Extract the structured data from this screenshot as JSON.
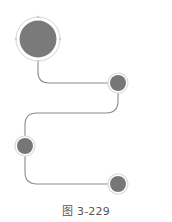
{
  "figure": {
    "caption": "图 3-229",
    "colors": {
      "node_fill": "#7a7a7a",
      "node_ring": "#d4d4d4",
      "connector": "#8a8a8a",
      "background": "#ffffff"
    },
    "nodes": [
      {
        "id": "node-1",
        "cx": 38,
        "cy": 39,
        "r": 18,
        "ring_r": 22,
        "size": "large"
      },
      {
        "id": "node-2",
        "cx": 118,
        "cy": 83,
        "r": 8,
        "ring_r": 10,
        "size": "small"
      },
      {
        "id": "node-3",
        "cx": 25,
        "cy": 146,
        "r": 8,
        "ring_r": 10,
        "size": "small"
      },
      {
        "id": "node-4",
        "cx": 118,
        "cy": 184,
        "r": 8,
        "ring_r": 10,
        "size": "small"
      }
    ],
    "connectors": [
      {
        "from": "node-1",
        "to": "node-2"
      },
      {
        "from": "node-2",
        "to": "node-3"
      },
      {
        "from": "node-3",
        "to": "node-4"
      }
    ]
  }
}
